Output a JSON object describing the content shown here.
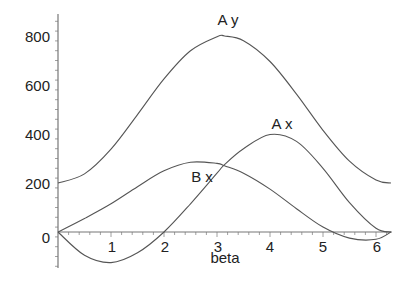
{
  "chart_data": {
    "type": "line",
    "title": "",
    "xlabel": "beta",
    "ylabel": "",
    "xlim": [
      0,
      6.283
    ],
    "ylim": [
      -170,
      900
    ],
    "x_ticks": [
      "1",
      "2",
      "3",
      "4",
      "5",
      "6"
    ],
    "y_ticks": [
      "0",
      "200",
      "400",
      "600",
      "800"
    ],
    "grid": false,
    "legend": "inline curve labels",
    "x": [
      0,
      0.5,
      1.0,
      1.5,
      2.0,
      2.5,
      3.0,
      3.1416,
      3.5,
      4.0,
      4.5,
      5.0,
      5.5,
      6.0,
      6.283
    ],
    "series": [
      {
        "name": "A y",
        "label_pos": [
          3.05,
          840
        ],
        "values": [
          200,
          237,
          338,
          479,
          625,
          740,
          797,
          800,
          781,
          696,
          563,
          415,
          289,
          212,
          200
        ]
      },
      {
        "name": "A x",
        "label_pos": [
          4.1,
          445
        ],
        "values": [
          0,
          -95,
          -125,
          -85,
          0,
          115,
          240,
          275,
          340,
          398,
          370,
          260,
          120,
          15,
          0
        ]
      },
      {
        "name": "B x",
        "label_pos": [
          2.65,
          335
        ],
        "values": [
          0,
          55,
          115,
          185,
          250,
          285,
          280,
          270,
          240,
          175,
          95,
          20,
          -25,
          -30,
          0
        ]
      }
    ]
  },
  "labels": {
    "xlabel": "beta",
    "ay": "A y",
    "ax": "A x",
    "bx": "B x",
    "y0": "0",
    "y200": "200",
    "y400": "400",
    "y600": "600",
    "y800": "800",
    "x1": "1",
    "x2": "2",
    "x3": "3",
    "x4": "4",
    "x5": "5",
    "x6": "6"
  }
}
